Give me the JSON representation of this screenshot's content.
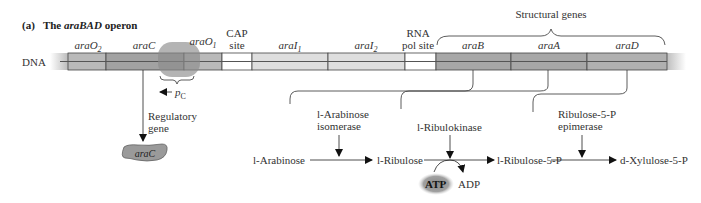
{
  "title": {
    "panel": "(a)",
    "prefix": "The ",
    "gene": "araBAD",
    "suffix": " operon"
  },
  "dna_label": "DNA",
  "regions": [
    {
      "id": "araO2",
      "base": "araO",
      "sub": "2",
      "color": "#b9b9b9"
    },
    {
      "id": "araC",
      "base": "araC",
      "sub": "",
      "color": "#a2a2a2"
    },
    {
      "id": "araO1",
      "base": "araO",
      "sub": "1",
      "color": "#b9b9b9"
    },
    {
      "id": "cap",
      "label1": "CAP",
      "label2": "site",
      "color": "#ffffff"
    },
    {
      "id": "araI1",
      "base": "araI",
      "sub": "1",
      "color": "#dedede"
    },
    {
      "id": "araI2",
      "base": "araI",
      "sub": "2",
      "color": "#dedede"
    },
    {
      "id": "rnapol",
      "label1": "RNA",
      "label2": "pol site",
      "color": "#ffffff"
    },
    {
      "id": "araB",
      "base": "araB",
      "sub": "",
      "color": "#a7a7a7"
    },
    {
      "id": "araA",
      "base": "araA",
      "sub": "",
      "color": "#a7a7a7"
    },
    {
      "id": "araD",
      "base": "araD",
      "sub": "",
      "color": "#b0b0b0"
    }
  ],
  "structural_genes_label": "Structural genes",
  "promoter": {
    "base": "p",
    "sub": "C"
  },
  "regulatory_gene": {
    "line1": "Regulatory",
    "line2": "gene"
  },
  "protein_label": "araC",
  "enzymes": {
    "isomerase": {
      "line1": "l-Arabinose",
      "line2": "isomerase"
    },
    "kinase": {
      "line1": "l-Ribulokinase"
    },
    "epimerase": {
      "line1": "Ribulose-5-P",
      "line2": "epimerase"
    }
  },
  "metabolites": [
    "l-Arabinose",
    "l-Ribulose",
    "l-Ribulose-5-P",
    "d-Xylulose-5-P"
  ],
  "cofactors": {
    "atp": "ATP",
    "adp": "ADP"
  }
}
